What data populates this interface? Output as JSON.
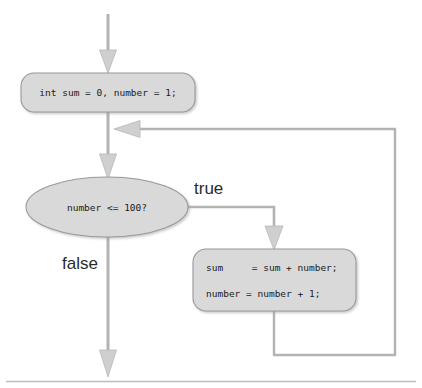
{
  "diagram": {
    "colors": {
      "shape_fill": "#d9d9d9",
      "shape_stroke": "#9a9a9a",
      "connector": "#b3b3b3",
      "connector_dark": "#a0a0a0",
      "text": "#1a1a1a",
      "rule": "#bdbdbd",
      "background": "#ffffff"
    },
    "nodes": {
      "init": {
        "type": "process-rounded",
        "text": "int sum = 0, number = 1;"
      },
      "condition": {
        "type": "decision-oval",
        "text": "number <= 100?"
      },
      "body": {
        "type": "process-rounded",
        "line1": "sum     = sum + number;",
        "line2": "number = number + 1;"
      }
    },
    "labels": {
      "true_branch": "true",
      "false_branch": "false"
    }
  }
}
